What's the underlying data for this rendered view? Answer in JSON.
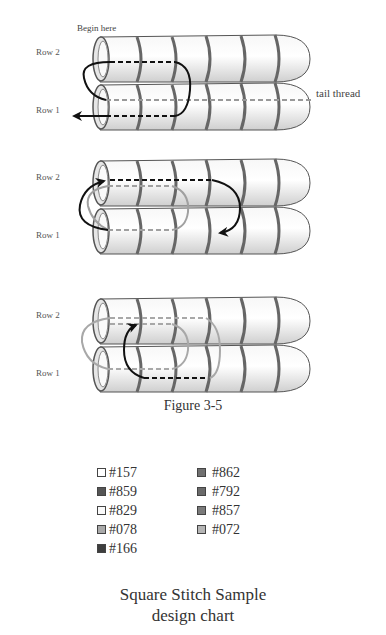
{
  "figure": {
    "caption": "Figure 3-5",
    "panels": [
      {
        "id": "step-1",
        "labels": {
          "row2": "Row 2",
          "row1": "Row 1",
          "begin": "Begin here",
          "tail": "tail thread"
        },
        "beads_per_row": 6
      },
      {
        "id": "step-2",
        "labels": {
          "row2": "Row 2",
          "row1": "Row 1"
        },
        "beads_per_row": 6
      },
      {
        "id": "step-3",
        "labels": {
          "row2": "Row 2",
          "row1": "Row 1"
        },
        "beads_per_row": 6
      }
    ]
  },
  "legend": {
    "left": [
      {
        "code": "#157",
        "color": "#ffffff"
      },
      {
        "code": "#859",
        "color": "#555555"
      },
      {
        "code": "#829",
        "color": "#fafafa"
      },
      {
        "code": "#078",
        "color": "#aaaaaa"
      },
      {
        "code": "#166",
        "color": "#3e3e3e"
      }
    ],
    "right": [
      {
        "code": "#862",
        "color": "#707070"
      },
      {
        "code": "#792",
        "color": "#6a6a6a"
      },
      {
        "code": "#857",
        "color": "#7a7a7a"
      },
      {
        "code": "#072",
        "color": "#b5b5b5"
      }
    ]
  },
  "title": {
    "line1": "Square Stitch Sample",
    "line2": "design chart"
  }
}
